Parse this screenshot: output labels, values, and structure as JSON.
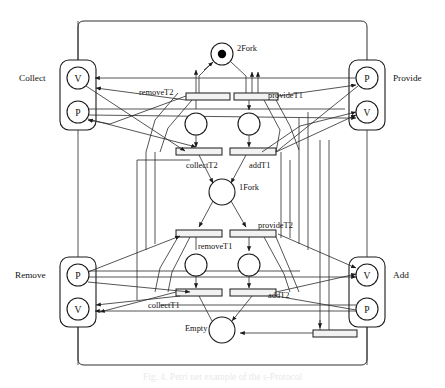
{
  "figure": {
    "caption": "Fig. 4. Petri net example of the s-Protocol",
    "type": "petri-net-diagram"
  },
  "modules": [
    {
      "id": "collect",
      "label": "Collect",
      "label_side": "left",
      "nodes": [
        "V",
        "P"
      ]
    },
    {
      "id": "provide",
      "label": "Provide",
      "label_side": "right",
      "nodes": [
        "P",
        "V"
      ]
    },
    {
      "id": "remove",
      "label": "Remove",
      "label_side": "left",
      "nodes": [
        "P",
        "V"
      ]
    },
    {
      "id": "add",
      "label": "Add",
      "label_side": "right",
      "nodes": [
        "V",
        "P"
      ]
    }
  ],
  "places": [
    {
      "id": "p2fork",
      "label": "2Fork",
      "tokens": 1,
      "label_pos": "right"
    },
    {
      "id": "p1fork",
      "label": "1Fork",
      "tokens": 0,
      "label_pos": "right"
    },
    {
      "id": "pempty",
      "label": "Empty",
      "tokens": 0,
      "label_pos": "left"
    },
    {
      "id": "pi1",
      "label": "",
      "tokens": 0,
      "label_pos": "none"
    },
    {
      "id": "pi2",
      "label": "",
      "tokens": 0,
      "label_pos": "none"
    },
    {
      "id": "pi3",
      "label": "",
      "tokens": 0,
      "label_pos": "none"
    },
    {
      "id": "pi4",
      "label": "",
      "tokens": 0,
      "label_pos": "none"
    }
  ],
  "transitions": [
    {
      "id": "removeT2",
      "label": "removeT2",
      "label_pos": "left"
    },
    {
      "id": "provideT1",
      "label": "provideT1",
      "label_pos": "right"
    },
    {
      "id": "collectT2",
      "label": "collectT2",
      "label_pos": "below-left"
    },
    {
      "id": "addT1",
      "label": "addT1",
      "label_pos": "below-right"
    },
    {
      "id": "removeT1",
      "label": "removeT1",
      "label_pos": "below-right"
    },
    {
      "id": "provideT2",
      "label": "provideT2",
      "label_pos": "above-right"
    },
    {
      "id": "collectT1",
      "label": "collectT1",
      "label_pos": "below-left"
    },
    {
      "id": "addT2",
      "label": "addT2",
      "label_pos": "right"
    },
    {
      "id": "tbottom",
      "label": "",
      "label_pos": "none"
    }
  ],
  "colors": {
    "stroke": "#1a1a1a",
    "transition_fill": "#f2f2f2",
    "place_fill": "#ffffff",
    "token": "#000000",
    "background": "#ffffff"
  }
}
